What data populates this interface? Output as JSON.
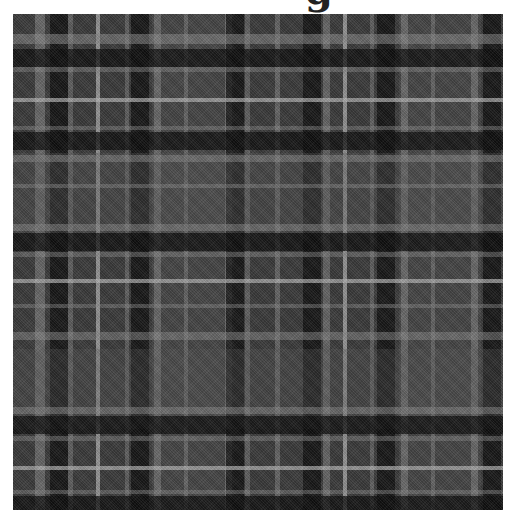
{
  "title_fragment": "g",
  "swatch": {
    "left": 13,
    "top": 14,
    "width": 490,
    "height": 496,
    "base_color": "#3a3a3a",
    "colors": {
      "black": "#0d0d0d",
      "dark": "#1f1f1f",
      "mid_light": "#5a5a5a",
      "light_band": "#4a4a4a",
      "white_line": "#b5b5b5",
      "gray_line": "#8a8a8a"
    },
    "vertical_stripes": [
      {
        "x": 22,
        "w": 10,
        "color": "#8a8a8a",
        "alpha": 0.55
      },
      {
        "x": 37,
        "w": 18,
        "color": "#0d0d0d",
        "alpha": 0.75
      },
      {
        "x": 55,
        "w": 5,
        "color": "#8a8a8a",
        "alpha": 0.45
      },
      {
        "x": 83,
        "w": 4,
        "color": "#b5b5b5",
        "alpha": 0.7
      },
      {
        "x": 112,
        "w": 4,
        "color": "#8a8a8a",
        "alpha": 0.45
      },
      {
        "x": 118,
        "w": 18,
        "color": "#0d0d0d",
        "alpha": 0.75
      },
      {
        "x": 139,
        "w": 82,
        "color": "#5a5a5a",
        "alpha": 0.35
      },
      {
        "x": 141,
        "w": 7,
        "color": "#8a8a8a",
        "alpha": 0.5
      },
      {
        "x": 171,
        "w": 4,
        "color": "#8a8a8a",
        "alpha": 0.45
      },
      {
        "x": 212,
        "w": 7,
        "color": "#8a8a8a",
        "alpha": 0.5
      },
      {
        "x": 213,
        "w": 18,
        "color": "#0d0d0d",
        "alpha": 0.75
      },
      {
        "x": 232,
        "w": 5,
        "color": "#8a8a8a",
        "alpha": 0.45
      },
      {
        "x": 262,
        "w": 5,
        "color": "#8a8a8a",
        "alpha": 0.5
      },
      {
        "x": 290,
        "w": 18,
        "color": "#0d0d0d",
        "alpha": 0.75
      },
      {
        "x": 310,
        "w": 7,
        "color": "#8a8a8a",
        "alpha": 0.5
      },
      {
        "x": 330,
        "w": 4,
        "color": "#b5b5b5",
        "alpha": 0.7
      },
      {
        "x": 357,
        "w": 4,
        "color": "#8a8a8a",
        "alpha": 0.45
      },
      {
        "x": 364,
        "w": 18,
        "color": "#0d0d0d",
        "alpha": 0.75
      },
      {
        "x": 386,
        "w": 82,
        "color": "#5a5a5a",
        "alpha": 0.35
      },
      {
        "x": 388,
        "w": 7,
        "color": "#8a8a8a",
        "alpha": 0.5
      },
      {
        "x": 418,
        "w": 4,
        "color": "#8a8a8a",
        "alpha": 0.45
      },
      {
        "x": 458,
        "w": 7,
        "color": "#8a8a8a",
        "alpha": 0.5
      },
      {
        "x": 470,
        "w": 18,
        "color": "#0d0d0d",
        "alpha": 0.75
      }
    ],
    "horizontal_stripes": [
      {
        "y": 20,
        "w": 10,
        "color": "#8a8a8a",
        "alpha": 0.55
      },
      {
        "y": 35,
        "w": 18,
        "color": "#0d0d0d",
        "alpha": 0.75
      },
      {
        "y": 53,
        "w": 5,
        "color": "#8a8a8a",
        "alpha": 0.45
      },
      {
        "y": 84,
        "w": 4,
        "color": "#b5b5b5",
        "alpha": 0.7
      },
      {
        "y": 112,
        "w": 4,
        "color": "#8a8a8a",
        "alpha": 0.45
      },
      {
        "y": 118,
        "w": 18,
        "color": "#0d0d0d",
        "alpha": 0.75
      },
      {
        "y": 139,
        "w": 80,
        "color": "#5a5a5a",
        "alpha": 0.35
      },
      {
        "y": 141,
        "w": 7,
        "color": "#8a8a8a",
        "alpha": 0.5
      },
      {
        "y": 170,
        "w": 4,
        "color": "#8a8a8a",
        "alpha": 0.45
      },
      {
        "y": 210,
        "w": 7,
        "color": "#8a8a8a",
        "alpha": 0.5
      },
      {
        "y": 219,
        "w": 18,
        "color": "#0d0d0d",
        "alpha": 0.75
      },
      {
        "y": 238,
        "w": 5,
        "color": "#8a8a8a",
        "alpha": 0.45
      },
      {
        "y": 265,
        "w": 4,
        "color": "#b5b5b5",
        "alpha": 0.7
      },
      {
        "y": 290,
        "w": 4,
        "color": "#8a8a8a",
        "alpha": 0.45
      },
      {
        "y": 318,
        "w": 8,
        "color": "#8a8a8a",
        "alpha": 0.5
      },
      {
        "y": 335,
        "w": 80,
        "color": "#5a5a5a",
        "alpha": 0.3
      },
      {
        "y": 393,
        "w": 7,
        "color": "#8a8a8a",
        "alpha": 0.5
      },
      {
        "y": 402,
        "w": 18,
        "color": "#0d0d0d",
        "alpha": 0.75
      },
      {
        "y": 422,
        "w": 5,
        "color": "#8a8a8a",
        "alpha": 0.45
      },
      {
        "y": 452,
        "w": 4,
        "color": "#b5b5b5",
        "alpha": 0.7
      },
      {
        "y": 476,
        "w": 4,
        "color": "#8a8a8a",
        "alpha": 0.45
      },
      {
        "y": 482,
        "w": 14,
        "color": "#0d0d0d",
        "alpha": 0.75
      }
    ]
  }
}
